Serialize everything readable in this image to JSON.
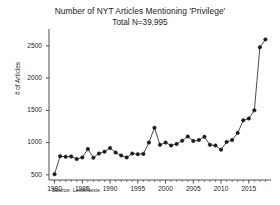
{
  "chart_data": {
    "type": "line",
    "title": "Number of NYT Articles Mentioning 'Privilege'",
    "subtitle": "Total N=39,995",
    "xlabel": "",
    "ylabel": "# of Articles",
    "source": "Source: LexisNexis",
    "grid": false,
    "legend": null,
    "marker": "filled-circle",
    "xlim": [
      1979,
      2019
    ],
    "ylim": [
      420,
      2700
    ],
    "xticks": [
      1980,
      1985,
      1990,
      1995,
      2000,
      2005,
      2010,
      2015
    ],
    "xtick_labels": [
      "1980",
      "1985",
      "1990",
      "1995",
      "2000",
      "2005",
      "2010",
      "2015"
    ],
    "yticks": [
      500,
      1000,
      1500,
      2000,
      2500
    ],
    "ytick_labels": [
      "500",
      "1000",
      "1500",
      "2000",
      "2500"
    ],
    "x": [
      1980,
      1981,
      1982,
      1983,
      1984,
      1985,
      1986,
      1987,
      1988,
      1989,
      1990,
      1991,
      1992,
      1993,
      1994,
      1995,
      1996,
      1997,
      1998,
      1999,
      2000,
      2001,
      2002,
      2003,
      2004,
      2005,
      2006,
      2007,
      2008,
      2009,
      2010,
      2011,
      2012,
      2013,
      2014,
      2015,
      2016,
      2017,
      2018
    ],
    "values": [
      510,
      790,
      780,
      785,
      745,
      770,
      900,
      765,
      830,
      860,
      915,
      845,
      800,
      770,
      830,
      820,
      825,
      1000,
      1230,
      965,
      1000,
      955,
      980,
      1030,
      1095,
      1025,
      1040,
      1090,
      965,
      955,
      890,
      1010,
      1040,
      1150,
      1345,
      1375,
      1500,
      2480,
      2600
    ]
  }
}
